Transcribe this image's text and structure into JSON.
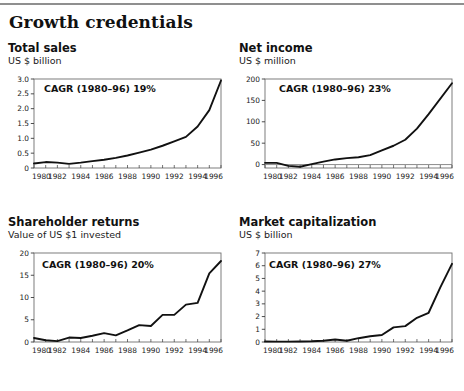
{
  "page": {
    "title": "Growth credentials"
  },
  "panels": [
    {
      "id": "total-sales",
      "title": "Total sales",
      "subtitle": "US $ billion",
      "cagr": "CAGR (1980–96) 19%"
    },
    {
      "id": "net-income",
      "title": "Net income",
      "subtitle": "US $ million",
      "cagr": "CAGR (1980–96) 23%"
    },
    {
      "id": "shareholder-returns",
      "title": "Shareholder returns",
      "subtitle": "Value of US $1 invested",
      "cagr": "CAGR (1980–96) 20%"
    },
    {
      "id": "market-capitalization",
      "title": "Market capitalization",
      "subtitle": "US $ billion",
      "cagr": "CAGR (1980–96) 27%"
    }
  ],
  "chart_data": [
    {
      "type": "line",
      "title": "Total sales",
      "subtitle": "US $ billion",
      "xlabel": "",
      "ylabel": "US $ billion",
      "annotation": "CAGR (1980–96) 19%",
      "grid": false,
      "legend": "none",
      "xlim": [
        1980,
        1996
      ],
      "ylim": [
        0,
        3.0
      ],
      "yticks": [
        0,
        0.5,
        1.0,
        1.5,
        2.0,
        2.5,
        3.0
      ],
      "yticklabels": [
        "0",
        "0.5",
        "1.0",
        "1.5",
        "2.0",
        "2.5",
        "3.0"
      ],
      "xticks": [
        1980,
        1982,
        1984,
        1986,
        1988,
        1990,
        1992,
        1994,
        1996
      ],
      "xticklabels": [
        "1980",
        "1982",
        "1984",
        "1986",
        "1988",
        "1990",
        "1992",
        "1994",
        "1996"
      ],
      "x": [
        1980,
        1981,
        1982,
        1983,
        1984,
        1985,
        1986,
        1987,
        1988,
        1989,
        1990,
        1991,
        1992,
        1993,
        1994,
        1995,
        1996
      ],
      "values": [
        0.15,
        0.2,
        0.18,
        0.14,
        0.18,
        0.23,
        0.28,
        0.34,
        0.42,
        0.52,
        0.62,
        0.75,
        0.9,
        1.05,
        1.4,
        1.95,
        2.95
      ]
    },
    {
      "type": "line",
      "title": "Net income",
      "subtitle": "US $ million",
      "xlabel": "",
      "ylabel": "US $ million",
      "annotation": "CAGR (1980–96) 23%",
      "grid": false,
      "legend": "none",
      "xlim": [
        1980,
        1996
      ],
      "ylim": [
        -8,
        200
      ],
      "yticks": [
        0,
        50,
        100,
        150,
        200
      ],
      "yticklabels": [
        "0",
        "50",
        "100",
        "150",
        "200"
      ],
      "xticks": [
        1980,
        1982,
        1984,
        1986,
        1988,
        1990,
        1992,
        1994,
        1996
      ],
      "xticklabels": [
        "1980",
        "1982",
        "1984",
        "1986",
        "1988",
        "1990",
        "1992",
        "1994",
        "1996"
      ],
      "x": [
        1980,
        1981,
        1982,
        1983,
        1984,
        1985,
        1986,
        1987,
        1988,
        1989,
        1990,
        1991,
        1992,
        1993,
        1994,
        1996
      ],
      "values": [
        4,
        4,
        -3,
        -5,
        1,
        7,
        12,
        15,
        17,
        22,
        33,
        44,
        58,
        84,
        118,
        190
      ]
    },
    {
      "type": "line",
      "title": "Shareholder returns",
      "subtitle": "Value of US $1 invested",
      "xlabel": "",
      "ylabel": "Value of US $1 invested",
      "annotation": "CAGR (1980–96) 20%",
      "grid": false,
      "legend": "none",
      "xlim": [
        1980,
        1996
      ],
      "ylim": [
        0,
        20
      ],
      "yticks": [
        0,
        5,
        10,
        15,
        20
      ],
      "yticklabels": [
        "0",
        "5",
        "10",
        "15",
        "20"
      ],
      "xticks": [
        1980,
        1982,
        1984,
        1986,
        1988,
        1990,
        1992,
        1994,
        1996
      ],
      "xticklabels": [
        "1980",
        "1982",
        "1984",
        "1986",
        "1988",
        "1990",
        "1992",
        "1994",
        "1996"
      ],
      "x": [
        1980,
        1981,
        1982,
        1983,
        1984,
        1985,
        1986,
        1987,
        1988,
        1989,
        1990,
        1991,
        1992,
        1993,
        1994,
        1995,
        1996
      ],
      "values": [
        0.9,
        0.4,
        0.2,
        1.0,
        0.9,
        1.4,
        2.0,
        1.5,
        2.6,
        3.8,
        3.6,
        6.1,
        6.1,
        8.4,
        8.8,
        15.4,
        18.2
      ]
    },
    {
      "type": "line",
      "title": "Market capitalization",
      "subtitle": "US $ billion",
      "xlabel": "",
      "ylabel": "US $ billion",
      "annotation": "CAGR (1980–96) 27%",
      "grid": false,
      "legend": "none",
      "xlim": [
        1980,
        1996
      ],
      "ylim": [
        0,
        7
      ],
      "yticks": [
        0,
        1,
        2,
        3,
        4,
        5,
        6,
        7
      ],
      "yticklabels": [
        "0",
        "1",
        "2",
        "3",
        "4",
        "5",
        "6",
        "7"
      ],
      "xticks": [
        1980,
        1982,
        1984,
        1986,
        1988,
        1990,
        1992,
        1994,
        1996
      ],
      "xticklabels": [
        "1980",
        "1982",
        "1984",
        "1986",
        "1988",
        "1990",
        "1992",
        "1994",
        "1996"
      ],
      "x": [
        1980,
        1981,
        1982,
        1983,
        1984,
        1985,
        1986,
        1987,
        1988,
        1989,
        1990,
        1991,
        1992,
        1993,
        1994,
        1995,
        1996
      ],
      "values": [
        0.04,
        0.03,
        0.03,
        0.04,
        0.06,
        0.1,
        0.2,
        0.1,
        0.3,
        0.45,
        0.55,
        1.15,
        1.25,
        1.9,
        2.3,
        4.3,
        6.15
      ]
    }
  ]
}
